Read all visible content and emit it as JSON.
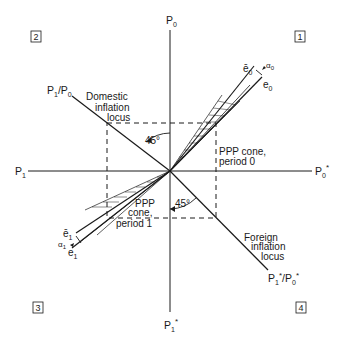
{
  "diagram": {
    "quadrants": [
      {
        "id": "1",
        "label": "1"
      },
      {
        "id": "2",
        "label": "2"
      },
      {
        "id": "3",
        "label": "3"
      },
      {
        "id": "4",
        "label": "4"
      }
    ],
    "axes": {
      "top": {
        "base": "P",
        "sub": "0",
        "star": ""
      },
      "bottom": {
        "base": "P",
        "sub": "1",
        "star": "*"
      },
      "left": {
        "base": "P",
        "sub": "1",
        "star": ""
      },
      "right": {
        "base": "P",
        "sub": "0",
        "star": "*"
      }
    },
    "loci": {
      "domestic": {
        "line1": "Domestic",
        "line2": "inflation",
        "line3": "locus",
        "endpoint_label": "P1/P0",
        "angle": "45°"
      },
      "foreign": {
        "line1": "Foreign",
        "line2": "inflation",
        "line3": "locus",
        "endpoint_label": "P1*/P0*",
        "angle": "45°"
      }
    },
    "cones": {
      "period0": {
        "line1": "PPP cone,",
        "line2": "period 0",
        "e_bar": "ē",
        "e": "e",
        "alpha": "α",
        "sub": "0"
      },
      "period1": {
        "line1": "PPP",
        "line2": "cone,",
        "line3": "period 1",
        "e_bar": "ē",
        "e": "e",
        "alpha": "α",
        "sub": "1"
      }
    },
    "colors": {
      "ink": "#1a1a1a",
      "background": "#ffffff"
    }
  }
}
